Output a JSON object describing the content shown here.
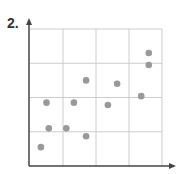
{
  "problem_label": "2.",
  "colors": {
    "grid": "#cccccc",
    "axis": "#444444",
    "dot": "#999999"
  },
  "chart_data": {
    "type": "scatter",
    "title": "",
    "xlabel": "",
    "ylabel": "",
    "grid": true,
    "grid_cells": [
      4,
      4
    ],
    "xlim": [
      0,
      4
    ],
    "ylim": [
      0,
      4
    ],
    "points": [
      {
        "x": 0.33,
        "y": 0.55
      },
      {
        "x": 0.57,
        "y": 1.1
      },
      {
        "x": 1.1,
        "y": 1.1
      },
      {
        "x": 1.7,
        "y": 0.87
      },
      {
        "x": 0.5,
        "y": 1.85
      },
      {
        "x": 1.33,
        "y": 1.85
      },
      {
        "x": 1.7,
        "y": 2.5
      },
      {
        "x": 2.36,
        "y": 1.78
      },
      {
        "x": 2.64,
        "y": 2.4
      },
      {
        "x": 3.37,
        "y": 2.04
      },
      {
        "x": 3.6,
        "y": 2.95
      },
      {
        "x": 3.6,
        "y": 3.3
      }
    ]
  }
}
